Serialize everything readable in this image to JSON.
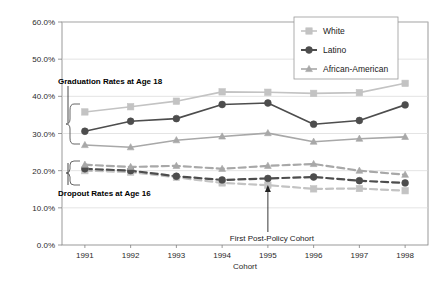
{
  "chart_data": {
    "type": "line",
    "title": "",
    "xlabel": "Cohort",
    "ylabel": "",
    "categories": [
      "1991",
      "1992",
      "1993",
      "1994",
      "1995",
      "1996",
      "1997",
      "1998"
    ],
    "ylim": [
      0,
      60
    ],
    "ytick_labels": [
      "0.0%",
      "10.0%",
      "20.0%",
      "30.0%",
      "40.0%",
      "50.0%",
      "60.0%"
    ],
    "ytick_values": [
      0,
      10,
      20,
      30,
      40,
      50,
      60
    ],
    "grid": true,
    "legend_position": "top-right",
    "legend": [
      "White",
      "Latino",
      "African-American"
    ],
    "colors": {
      "white": "#c3c3c3",
      "latino": "#4d4d4d",
      "african_american": "#a8a8a8",
      "grid": "#d9d9d9",
      "axis": "#808080"
    },
    "series": [
      {
        "name": "White",
        "group": "Graduation Rates at Age 18",
        "marker": "square",
        "dash": false,
        "color": "#c3c3c3",
        "values": [
          35.8,
          37.2,
          38.7,
          41.2,
          41.1,
          40.8,
          41.0,
          43.5
        ]
      },
      {
        "name": "Latino",
        "group": "Graduation Rates at Age 18",
        "marker": "circle",
        "dash": false,
        "color": "#4d4d4d",
        "values": [
          30.6,
          33.3,
          34.0,
          37.8,
          38.2,
          32.5,
          33.5,
          37.7
        ]
      },
      {
        "name": "African-American",
        "group": "Graduation Rates at Age 18",
        "marker": "triangle",
        "dash": false,
        "color": "#a8a8a8",
        "values": [
          26.9,
          26.3,
          28.2,
          29.2,
          30.1,
          27.8,
          28.6,
          29.1
        ]
      },
      {
        "name": "White",
        "group": "Dropout Rates at Age 16",
        "marker": "square",
        "dash": true,
        "color": "#c3c3c3",
        "values": [
          20.0,
          19.6,
          18.2,
          16.7,
          16.1,
          15.1,
          15.2,
          14.6
        ]
      },
      {
        "name": "Latino",
        "group": "Dropout Rates at Age 16",
        "marker": "circle",
        "dash": true,
        "color": "#4d4d4d",
        "values": [
          20.5,
          20.0,
          18.5,
          17.5,
          17.9,
          18.3,
          17.3,
          16.7
        ]
      },
      {
        "name": "African-American",
        "group": "Dropout Rates at Age 16",
        "marker": "triangle",
        "dash": true,
        "color": "#a8a8a8",
        "values": [
          21.6,
          21.0,
          21.3,
          20.5,
          21.3,
          21.8,
          20.0,
          18.9
        ]
      }
    ],
    "annotations": [
      {
        "id": "graduation-bracket",
        "text": "Graduation Rates at Age 18"
      },
      {
        "id": "dropout-bracket",
        "text": "Dropout Rates at Age 16"
      },
      {
        "id": "policy-arrow",
        "text": "First Post-Policy Cohort",
        "at_category": "1995"
      }
    ]
  }
}
